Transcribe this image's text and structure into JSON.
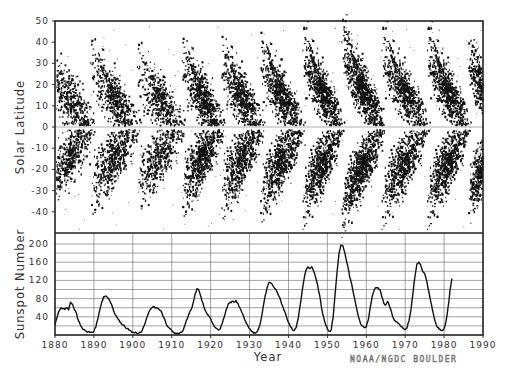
{
  "chart_data": [
    {
      "type": "scatter",
      "title": "Butterfly Diagram",
      "xlabel": "",
      "ylabel": "Solar Latitude",
      "xlim": [
        1880,
        1990
      ],
      "ylim": [
        -50,
        50
      ],
      "yticks": [
        50,
        40,
        30,
        20,
        10,
        0,
        -10,
        -20,
        -30,
        -40
      ],
      "ytick_labels": [
        "50",
        "40",
        "30",
        "20",
        "10",
        "0",
        "-10",
        "-20",
        "-30",
        "-40"
      ],
      "equator_line": true,
      "grid": false,
      "cycles": [
        {
          "start": 1878.0,
          "end": 1890.5,
          "max": 1884.0,
          "lat_start": 30,
          "lat_end": 3,
          "intensity": 0.6
        },
        {
          "start": 1889.0,
          "end": 1902.0,
          "max": 1894.0,
          "lat_start": 32,
          "lat_end": 3,
          "intensity": 0.7
        },
        {
          "start": 1901.0,
          "end": 1913.5,
          "max": 1906.0,
          "lat_start": 30,
          "lat_end": 3,
          "intensity": 0.6
        },
        {
          "start": 1912.5,
          "end": 1923.5,
          "max": 1917.5,
          "lat_start": 33,
          "lat_end": 3,
          "intensity": 0.85
        },
        {
          "start": 1922.5,
          "end": 1933.8,
          "max": 1928.0,
          "lat_start": 34,
          "lat_end": 3,
          "intensity": 0.8
        },
        {
          "start": 1932.5,
          "end": 1944.2,
          "max": 1937.5,
          "lat_start": 36,
          "lat_end": 3,
          "intensity": 0.95
        },
        {
          "start": 1943.5,
          "end": 1954.3,
          "max": 1947.5,
          "lat_start": 38,
          "lat_end": 3,
          "intensity": 1.0
        },
        {
          "start": 1953.5,
          "end": 1964.8,
          "max": 1957.8,
          "lat_start": 42,
          "lat_end": 3,
          "intensity": 1.1
        },
        {
          "start": 1963.8,
          "end": 1976.3,
          "max": 1968.9,
          "lat_start": 38,
          "lat_end": 3,
          "intensity": 0.9
        },
        {
          "start": 1975.5,
          "end": 1986.8,
          "max": 1979.9,
          "lat_start": 38,
          "lat_end": 3,
          "intensity": 1.0
        },
        {
          "start": 1986.0,
          "end": 1996.0,
          "max": 1989.6,
          "lat_start": 36,
          "lat_end": 3,
          "intensity": 1.0
        }
      ]
    },
    {
      "type": "line",
      "title": "Sunspot Number",
      "xlabel": "Year",
      "ylabel": "Sunspot Number",
      "xlim": [
        1880,
        1990
      ],
      "ylim": [
        0,
        210
      ],
      "yticks": [
        200,
        160,
        120,
        80,
        40
      ],
      "ytick_labels": [
        "200",
        "160",
        "120",
        "80",
        "40"
      ],
      "minor_grid_step": 20,
      "xticks": [
        1880,
        1890,
        1900,
        1910,
        1920,
        1930,
        1940,
        1950,
        1960,
        1970,
        1980,
        1990
      ],
      "xtick_labels": [
        "1880",
        "1890",
        "1900",
        "1910",
        "1920",
        "1930",
        "1940",
        "1950",
        "1960",
        "1970",
        "1980",
        "1990"
      ],
      "grid": true,
      "x": [
        1880.0,
        1880.5,
        1881.0,
        1881.5,
        1882.0,
        1882.5,
        1883.0,
        1883.5,
        1884.0,
        1884.5,
        1885.0,
        1885.5,
        1886.0,
        1886.5,
        1887.0,
        1887.5,
        1888.0,
        1888.5,
        1889.0,
        1889.5,
        1890.0,
        1890.5,
        1891.0,
        1891.5,
        1892.0,
        1892.5,
        1893.0,
        1893.5,
        1894.0,
        1894.5,
        1895.0,
        1895.5,
        1896.0,
        1896.5,
        1897.0,
        1897.5,
        1898.0,
        1898.5,
        1899.0,
        1899.5,
        1900.0,
        1900.5,
        1901.0,
        1901.5,
        1902.0,
        1902.5,
        1903.0,
        1903.5,
        1904.0,
        1904.5,
        1905.0,
        1905.5,
        1906.0,
        1906.5,
        1907.0,
        1907.5,
        1908.0,
        1908.5,
        1909.0,
        1909.5,
        1910.0,
        1910.5,
        1911.0,
        1911.5,
        1912.0,
        1912.5,
        1913.0,
        1913.5,
        1914.0,
        1914.5,
        1915.0,
        1915.5,
        1916.0,
        1916.5,
        1917.0,
        1917.5,
        1918.0,
        1918.5,
        1919.0,
        1919.5,
        1920.0,
        1920.5,
        1921.0,
        1921.5,
        1922.0,
        1922.5,
        1923.0,
        1923.5,
        1924.0,
        1924.5,
        1925.0,
        1925.5,
        1926.0,
        1926.5,
        1927.0,
        1927.5,
        1928.0,
        1928.5,
        1929.0,
        1929.5,
        1930.0,
        1930.5,
        1931.0,
        1931.5,
        1932.0,
        1932.5,
        1933.0,
        1933.5,
        1934.0,
        1934.5,
        1935.0,
        1935.5,
        1936.0,
        1936.5,
        1937.0,
        1937.5,
        1938.0,
        1938.5,
        1939.0,
        1939.5,
        1940.0,
        1940.5,
        1941.0,
        1941.5,
        1942.0,
        1942.5,
        1943.0,
        1943.5,
        1944.0,
        1944.5,
        1945.0,
        1945.5,
        1946.0,
        1946.5,
        1947.0,
        1947.5,
        1948.0,
        1948.5,
        1949.0,
        1949.5,
        1950.0,
        1950.5,
        1951.0,
        1951.5,
        1952.0,
        1952.5,
        1953.0,
        1953.5,
        1954.0,
        1954.5,
        1955.0,
        1955.5,
        1956.0,
        1956.5,
        1957.0,
        1957.5,
        1958.0,
        1958.5,
        1959.0,
        1959.5,
        1960.0,
        1960.5,
        1961.0,
        1961.5,
        1962.0,
        1962.5,
        1963.0,
        1963.5,
        1964.0,
        1964.5,
        1965.0,
        1965.5,
        1966.0,
        1966.5,
        1967.0,
        1967.5,
        1968.0,
        1968.5,
        1969.0,
        1969.5,
        1970.0,
        1970.5,
        1971.0,
        1971.5,
        1972.0,
        1972.5,
        1973.0,
        1973.5,
        1974.0,
        1974.5,
        1975.0,
        1975.5,
        1976.0,
        1976.5,
        1977.0,
        1977.5,
        1978.0,
        1978.5,
        1979.0,
        1979.5,
        1980.0,
        1980.5,
        1981.0,
        1981.5,
        1982.0,
        1982.5,
        1983.0,
        1983.5,
        1984.0,
        1984.5,
        1985.0,
        1985.5,
        1986.0,
        1986.5,
        1987.0,
        1987.5,
        1988.0,
        1988.5,
        1989.0,
        1989.5
      ],
      "series": [
        {
          "name": "Smoothed sunspot number",
          "values": [
            22,
            38,
            52,
            60,
            58,
            56,
            60,
            55,
            72,
            68,
            55,
            48,
            32,
            22,
            15,
            12,
            8,
            7,
            6,
            6,
            8,
            18,
            35,
            55,
            72,
            84,
            86,
            82,
            76,
            68,
            55,
            44,
            38,
            32,
            26,
            22,
            18,
            14,
            11,
            9,
            6,
            5,
            4,
            4,
            6,
            12,
            22,
            36,
            48,
            56,
            60,
            62,
            60,
            58,
            54,
            48,
            38,
            26,
            18,
            14,
            10,
            6,
            4,
            4,
            4,
            6,
            12,
            24,
            36,
            48,
            56,
            70,
            90,
            102,
            98,
            84,
            70,
            56,
            48,
            42,
            36,
            26,
            18,
            14,
            11,
            14,
            26,
            40,
            56,
            68,
            72,
            74,
            72,
            76,
            70,
            60,
            50,
            40,
            30,
            22,
            14,
            8,
            4,
            4,
            8,
            18,
            36,
            62,
            86,
            104,
            116,
            114,
            108,
            102,
            96,
            86,
            76,
            64,
            52,
            40,
            28,
            18,
            12,
            10,
            16,
            36,
            64,
            96,
            122,
            142,
            150,
            146,
            150,
            140,
            126,
            110,
            88,
            60,
            40,
            24,
            14,
            8,
            12,
            40,
            90,
            140,
            180,
            198,
            196,
            180,
            160,
            140,
            120,
            100,
            80,
            60,
            40,
            26,
            20,
            16,
            18,
            32,
            60,
            84,
            98,
            104,
            104,
            100,
            84,
            70,
            66,
            74,
            62,
            50,
            36,
            30,
            28,
            24,
            18,
            14,
            12,
            16,
            32,
            56,
            92,
            128,
            156,
            160,
            154,
            140,
            136,
            120,
            98,
            76,
            56,
            36,
            22,
            16,
            12,
            10,
            14,
            30,
            60,
            96,
            124
          ]
        }
      ]
    }
  ],
  "panels": {
    "top": {
      "ylabel": "Solar Latitude"
    },
    "bottom": {
      "ylabel": "Sunspot Number",
      "xlabel": "Year"
    }
  },
  "credit": "NOAA/NGDC BOULDER",
  "colors": {
    "ink": "#111111",
    "grid": "#555555",
    "equator": "#999999",
    "background": "#ffffff"
  }
}
